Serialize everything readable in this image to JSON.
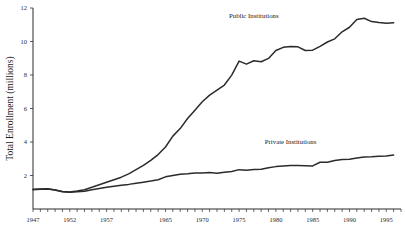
{
  "chart_data": {
    "type": "line",
    "title": "",
    "xlabel": "",
    "ylabel": "Total Enrollment (millions)",
    "xlim": [
      1947,
      1997
    ],
    "ylim": [
      0,
      12
    ],
    "grid": false,
    "legend_position": "inline-annotations",
    "y_ticks": [
      2,
      4,
      6,
      8,
      10,
      12
    ],
    "y_tick_labels": [
      "2",
      "4",
      "6",
      "8",
      "10",
      "12"
    ],
    "x_ticks": [
      1947,
      1952,
      1957,
      1965,
      1970,
      1975,
      1980,
      1985,
      1990,
      1995
    ],
    "x_tick_labels": [
      "1947",
      "1952",
      "1957",
      "1965",
      "1970",
      "1975",
      "1980",
      "1985",
      "1990",
      "1995"
    ],
    "x_minor_tick_interval": 1,
    "annotations": [
      {
        "text": "Public Institutions",
        "x": 1977,
        "y": 11.4
      },
      {
        "text": "Private Institutions",
        "x": 1982,
        "y": 3.9
      }
    ],
    "series": [
      {
        "name": "Public Institutions",
        "x": [
          1947,
          1948,
          1949,
          1950,
          1951,
          1952,
          1953,
          1954,
          1955,
          1956,
          1957,
          1958,
          1959,
          1960,
          1961,
          1962,
          1963,
          1964,
          1965,
          1966,
          1967,
          1968,
          1969,
          1970,
          1971,
          1972,
          1973,
          1974,
          1975,
          1976,
          1977,
          1978,
          1979,
          1980,
          1981,
          1982,
          1983,
          1984,
          1985,
          1986,
          1987,
          1988,
          1989,
          1990,
          1991,
          1992,
          1993,
          1994,
          1995,
          1996
        ],
        "values": [
          1.15,
          1.18,
          1.2,
          1.14,
          1.04,
          1.02,
          1.08,
          1.15,
          1.3,
          1.45,
          1.6,
          1.75,
          1.9,
          2.1,
          2.35,
          2.6,
          2.9,
          3.25,
          3.7,
          4.35,
          4.8,
          5.4,
          5.9,
          6.4,
          6.8,
          7.1,
          7.4,
          7.99,
          8.83,
          8.65,
          8.85,
          8.79,
          8.99,
          9.46,
          9.65,
          9.7,
          9.68,
          9.46,
          9.48,
          9.71,
          9.97,
          10.16,
          10.58,
          10.85,
          11.31,
          11.39,
          11.19,
          11.13,
          11.09,
          11.12
        ]
      },
      {
        "name": "Private Institutions",
        "x": [
          1947,
          1948,
          1949,
          1950,
          1951,
          1952,
          1953,
          1954,
          1955,
          1956,
          1957,
          1958,
          1959,
          1960,
          1961,
          1962,
          1963,
          1964,
          1965,
          1966,
          1967,
          1968,
          1969,
          1970,
          1971,
          1972,
          1973,
          1974,
          1975,
          1976,
          1977,
          1978,
          1979,
          1980,
          1981,
          1982,
          1983,
          1984,
          1985,
          1986,
          1987,
          1988,
          1989,
          1990,
          1991,
          1992,
          1993,
          1994,
          1995,
          1996
        ],
        "values": [
          1.18,
          1.2,
          1.21,
          1.14,
          1.03,
          1.0,
          1.03,
          1.06,
          1.15,
          1.22,
          1.3,
          1.36,
          1.42,
          1.47,
          1.54,
          1.6,
          1.67,
          1.75,
          1.92,
          2.0,
          2.08,
          2.1,
          2.15,
          2.15,
          2.18,
          2.14,
          2.19,
          2.24,
          2.35,
          2.31,
          2.36,
          2.37,
          2.46,
          2.53,
          2.57,
          2.6,
          2.6,
          2.58,
          2.57,
          2.79,
          2.79,
          2.89,
          2.95,
          2.97,
          3.05,
          3.1,
          3.12,
          3.15,
          3.17,
          3.22
        ]
      }
    ]
  }
}
